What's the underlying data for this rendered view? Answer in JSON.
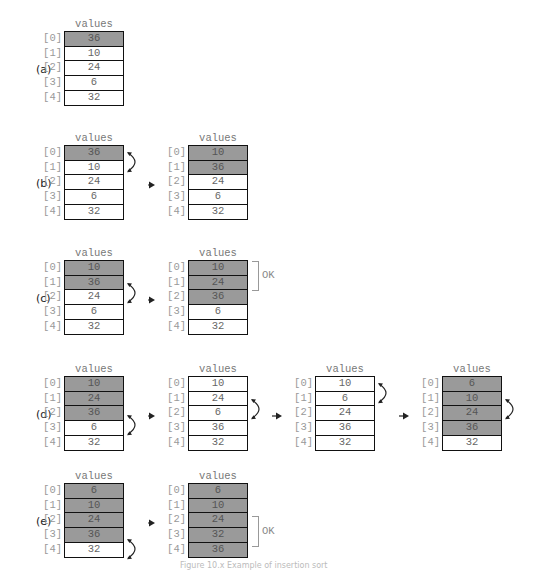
{
  "array_name": "values",
  "indices": [
    "[0]",
    "[1]",
    "[2]",
    "[3]",
    "[4]"
  ],
  "ok_label": "OK",
  "panels": [
    {
      "label": "(a)",
      "arrays": [
        {
          "values": [
            "36",
            "10",
            "24",
            "6",
            "32"
          ],
          "sorted": [
            true,
            false,
            false,
            false,
            false
          ],
          "swap_rows": null
        }
      ],
      "ok": null
    },
    {
      "label": "(b)",
      "arrays": [
        {
          "values": [
            "36",
            "10",
            "24",
            "6",
            "32"
          ],
          "sorted": [
            true,
            false,
            false,
            false,
            false
          ],
          "swap_rows": [
            0,
            1
          ]
        },
        {
          "values": [
            "10",
            "36",
            "24",
            "6",
            "32"
          ],
          "sorted": [
            true,
            true,
            false,
            false,
            false
          ],
          "swap_rows": null
        }
      ],
      "ok": null
    },
    {
      "label": "(c)",
      "arrays": [
        {
          "values": [
            "10",
            "36",
            "24",
            "6",
            "32"
          ],
          "sorted": [
            true,
            true,
            false,
            false,
            false
          ],
          "swap_rows": [
            1,
            2
          ]
        },
        {
          "values": [
            "10",
            "24",
            "36",
            "6",
            "32"
          ],
          "sorted": [
            true,
            true,
            true,
            false,
            false
          ],
          "swap_rows": null
        }
      ],
      "ok": {
        "array": 1,
        "rows": [
          0,
          1
        ]
      }
    },
    {
      "label": "(d)",
      "arrays": [
        {
          "values": [
            "10",
            "24",
            "36",
            "6",
            "32"
          ],
          "sorted": [
            true,
            true,
            true,
            false,
            false
          ],
          "swap_rows": [
            2,
            3
          ]
        },
        {
          "values": [
            "10",
            "24",
            "6",
            "36",
            "32"
          ],
          "sorted": [
            false,
            false,
            false,
            false,
            false
          ],
          "swap_rows": [
            1,
            2
          ]
        },
        {
          "values": [
            "10",
            "6",
            "24",
            "36",
            "32"
          ],
          "sorted": [
            false,
            false,
            false,
            false,
            false
          ],
          "swap_rows": [
            0,
            1
          ]
        },
        {
          "values": [
            "6",
            "10",
            "24",
            "36",
            "32"
          ],
          "sorted": [
            true,
            true,
            true,
            true,
            false
          ],
          "swap_rows": [
            1,
            2
          ]
        }
      ],
      "ok": null
    },
    {
      "label": "(e)",
      "arrays": [
        {
          "values": [
            "6",
            "10",
            "24",
            "36",
            "32"
          ],
          "sorted": [
            true,
            true,
            true,
            true,
            false
          ],
          "swap_rows": [
            3,
            4
          ]
        },
        {
          "values": [
            "6",
            "10",
            "24",
            "32",
            "36"
          ],
          "sorted": [
            true,
            true,
            true,
            true,
            true
          ],
          "swap_rows": null
        }
      ],
      "ok": {
        "array": 1,
        "rows": [
          2,
          3
        ]
      }
    }
  ],
  "caption": "Figure 10.x  Example of insertion sort"
}
